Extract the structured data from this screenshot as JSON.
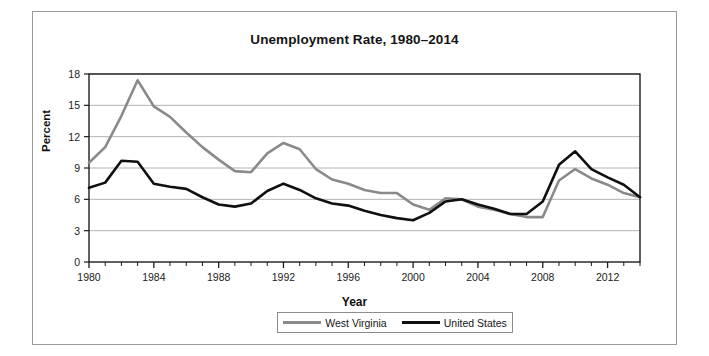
{
  "chart_data": {
    "type": "line",
    "title": "Unemployment Rate, 1980–2014",
    "xlabel": "Year",
    "ylabel": "Percent",
    "xlim": [
      1980,
      2014
    ],
    "ylim": [
      0,
      18
    ],
    "yticks": [
      0,
      3,
      6,
      9,
      12,
      15,
      18
    ],
    "xticks": [
      1980,
      1984,
      1988,
      1992,
      1996,
      2000,
      2004,
      2008,
      2012
    ],
    "xtick_step_minor": 1,
    "grid": "horizontal",
    "legend_position": "bottom",
    "x": [
      1980,
      1981,
      1982,
      1983,
      1984,
      1985,
      1986,
      1987,
      1988,
      1989,
      1990,
      1991,
      1992,
      1993,
      1994,
      1995,
      1996,
      1997,
      1998,
      1999,
      2000,
      2001,
      2002,
      2003,
      2004,
      2005,
      2006,
      2007,
      2008,
      2009,
      2010,
      2011,
      2012,
      2013,
      2014
    ],
    "series": [
      {
        "name": "West Virginia",
        "color": "#8a8a8a",
        "values": [
          9.5,
          11.0,
          14.0,
          17.4,
          14.9,
          13.9,
          12.4,
          11.0,
          9.8,
          8.7,
          8.6,
          10.4,
          11.4,
          10.8,
          8.9,
          7.9,
          7.5,
          6.9,
          6.6,
          6.6,
          5.5,
          5.0,
          6.1,
          6.0,
          5.3,
          5.0,
          4.6,
          4.3,
          4.3,
          7.8,
          8.9,
          8.0,
          7.4,
          6.6,
          6.2
        ]
      },
      {
        "name": "United States",
        "color": "#101010",
        "values": [
          7.1,
          7.6,
          9.7,
          9.6,
          7.5,
          7.2,
          7.0,
          6.2,
          5.5,
          5.3,
          5.6,
          6.8,
          7.5,
          6.9,
          6.1,
          5.6,
          5.4,
          4.9,
          4.5,
          4.2,
          4.0,
          4.7,
          5.8,
          6.0,
          5.5,
          5.1,
          4.6,
          4.6,
          5.8,
          9.3,
          10.6,
          8.9,
          8.1,
          7.4,
          6.2
        ]
      }
    ]
  },
  "legend": {
    "items": [
      {
        "label": "West Virginia",
        "color": "#8a8a8a"
      },
      {
        "label": "United States",
        "color": "#101010"
      }
    ]
  }
}
